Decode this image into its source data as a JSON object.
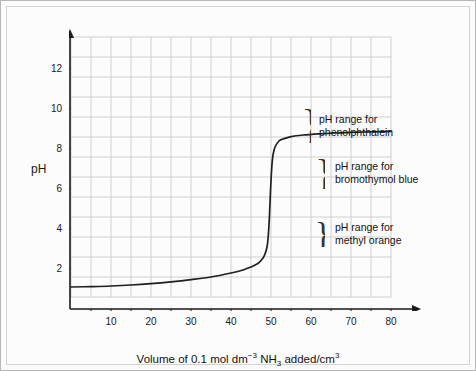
{
  "chart_data": {
    "type": "line",
    "title": "",
    "xlabel": "Volume of 0.1 mol dm-3 NH3 added/cm3",
    "ylabel": "pH",
    "xlim": [
      0,
      83
    ],
    "ylim": [
      0,
      13.6
    ],
    "grid": true,
    "legend": "none",
    "x_ticks_labeled": [
      10,
      20,
      30,
      40,
      50,
      60,
      70,
      80
    ],
    "x_ticks_minor_step": 5,
    "y_ticks_labeled": [
      2,
      4,
      6,
      8,
      10,
      12
    ],
    "y_gridline_step": 1,
    "series": [
      {
        "name": "titration curve",
        "x": [
          0,
          5,
          10,
          15,
          20,
          25,
          30,
          35,
          40,
          43,
          45,
          46,
          47,
          48,
          48.5,
          49,
          49.3,
          49.6,
          49.9,
          50.2,
          50.5,
          51,
          52,
          53,
          55,
          58,
          62,
          66,
          70,
          75,
          80
        ],
        "y": [
          1.1,
          1.12,
          1.15,
          1.2,
          1.27,
          1.36,
          1.47,
          1.6,
          1.8,
          1.95,
          2.1,
          2.2,
          2.32,
          2.55,
          2.75,
          3.1,
          3.6,
          4.6,
          6.0,
          7.1,
          7.7,
          8.1,
          8.4,
          8.5,
          8.62,
          8.7,
          8.76,
          8.8,
          8.83,
          8.86,
          8.88
        ]
      }
    ],
    "annotations": [
      {
        "id": "phenolphthalein",
        "line1": "pH range for",
        "line2": "phenolphthalein",
        "brace_y_range": [
          8.3,
          10.0
        ]
      },
      {
        "id": "bromothymol-blue",
        "line1": "pH range for",
        "line2": "bromothymol blue",
        "brace_y_range": [
          6.0,
          7.6
        ]
      },
      {
        "id": "methyl-orange",
        "line1": "pH range for",
        "line2": "methyl orange",
        "brace_y_range": [
          3.1,
          4.4
        ]
      }
    ]
  },
  "axis": {
    "y_title": "pH",
    "x_title_parts": {
      "pre": "Volume of 0.1 mol dm",
      "sup1": "−3",
      "mid": " NH",
      "sub1": "3",
      "post": " added/cm",
      "sup2": "3"
    }
  },
  "colors": {
    "curve": "#1f1f1f",
    "grid": "#c9c9c9",
    "axis": "#1a1a1a",
    "background": "#fcfcfc",
    "frame": "#b6b6b6",
    "text": "#111111"
  }
}
